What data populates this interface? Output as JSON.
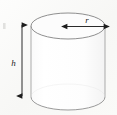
{
  "figure": {
    "type": "geometry-diagram",
    "background_color": "#fbfbfa",
    "paper_tint": "#f4f4f2",
    "ink_color": "#1d1d1d",
    "outline_color": "#9a9a9a",
    "body_fill": "#fdfdfd",
    "top_face_fill": "#fbfbfb",
    "labels": {
      "height": "h",
      "radius": "r"
    },
    "annotations": [
      {
        "name": "height-dimension",
        "label": "h",
        "orientation": "vertical",
        "arrowheads": "double",
        "x": 22,
        "y_start": 22,
        "y_end": 99,
        "label_x": 16,
        "label_y": 63
      },
      {
        "name": "radius-dimension",
        "label": "r",
        "orientation": "horizontal",
        "arrowheads": "double",
        "y": 26,
        "x_start": 66,
        "x_end": 105,
        "label_x": 87,
        "label_y": 21
      }
    ],
    "cylinder_geometry": {
      "center_x": 68,
      "top_ellipse_cy": 26,
      "bottom_ellipse_cy": 97,
      "rx": 37,
      "ry": 13
    },
    "artifacts": [
      {
        "name": "scan-speck-left",
        "x": 3,
        "y": 23,
        "width": 3,
        "height": 6
      }
    ]
  }
}
